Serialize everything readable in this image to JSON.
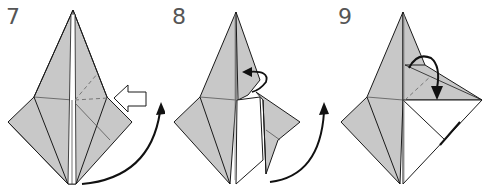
{
  "diagram": {
    "type": "origami-instructions",
    "colors": {
      "paper_colored": "#c8c8c8",
      "paper_white": "#ffffff",
      "crease_line": "#1a1a1a",
      "valley_fold_dash": "#777777",
      "arrow": "#111111",
      "step_number": "#555555"
    },
    "steps": [
      {
        "number": "7",
        "icons": [
          "push-in-hollow-arrow",
          "turn-over-curved-arrow"
        ]
      },
      {
        "number": "8",
        "icons": [
          "fold-behind-arrow",
          "turn-over-curved-arrow"
        ]
      },
      {
        "number": "9",
        "icons": [
          "valley-fold-arrow"
        ]
      }
    ]
  }
}
